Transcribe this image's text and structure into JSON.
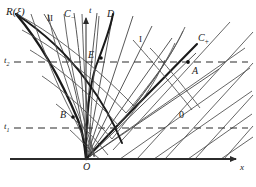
{
  "figure": {
    "type": "characteristics-spacetime-diagram",
    "title_caption": "",
    "background": "#ffffff",
    "ink": "#2b2b2b",
    "axes": {
      "x_label": "x",
      "t_label": "t",
      "origin_label": "O",
      "x_axis": {
        "x1": 10,
        "y1": 159,
        "x2": 243,
        "y2": 159
      },
      "t_axis": {
        "x1": 86,
        "y1": 159,
        "x2": 86,
        "y2": 12
      }
    },
    "time_levels": [
      {
        "label": "t",
        "sub": "2",
        "y": 62,
        "x_text": 6,
        "x_start": 14,
        "x_end": 248
      },
      {
        "label": "t",
        "sub": "1",
        "y": 128,
        "x_text": 6,
        "x_start": 14,
        "x_end": 248
      }
    ],
    "points": [
      {
        "name": "A",
        "x": 188,
        "y": 62,
        "label_dx": 4,
        "label_dy": 9,
        "marker": true
      },
      {
        "name": "B",
        "x": 72,
        "y": 118,
        "label_dx": -12,
        "label_dy": 1,
        "marker": true
      },
      {
        "name": "E",
        "x": 101,
        "y": 58,
        "label_dx": -13,
        "label_dy": -1,
        "marker": true
      },
      {
        "name": "O",
        "x": 86,
        "y": 159,
        "label_dx": -3,
        "label_dy": 13,
        "marker": false
      }
    ],
    "curve_labels": [
      {
        "name": "R-xi",
        "text": "R(ξ)",
        "x": 6,
        "y": 10
      },
      {
        "name": "C-minus",
        "text": "C",
        "sub": "−",
        "x": 65,
        "y": 12
      },
      {
        "name": "C-plus",
        "text": "C",
        "sub": "+",
        "x": 199,
        "y": 39
      },
      {
        "name": "D",
        "text": "D",
        "x": 107,
        "y": 14
      },
      {
        "name": "region-II",
        "text": "II",
        "x": 47,
        "y": 19,
        "upright": true
      },
      {
        "name": "region-I",
        "text": "I",
        "x": 139,
        "y": 40,
        "upright": true
      },
      {
        "name": "region-0",
        "text": "0",
        "x": 180,
        "y": 117,
        "upright": true
      }
    ],
    "regions": {
      "fan_apex": {
        "x": 86,
        "y": 159
      },
      "uniform_state": "0",
      "interaction_state": "I",
      "reflected_state": "II"
    }
  }
}
